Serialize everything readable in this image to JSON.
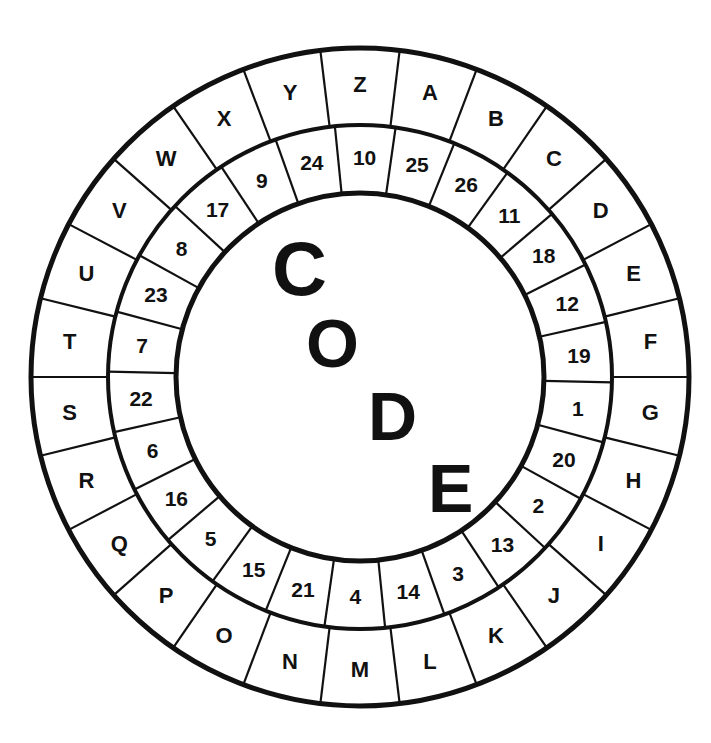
{
  "diagram": {
    "title_letters": [
      "C",
      "O",
      "D",
      "E"
    ],
    "colors": {
      "ink": "#111111",
      "background": "#ffffff"
    },
    "direction": "clockwise from top",
    "segments": [
      {
        "letter": "Z",
        "number": "10"
      },
      {
        "letter": "A",
        "number": "25"
      },
      {
        "letter": "B",
        "number": "26"
      },
      {
        "letter": "C",
        "number": "11"
      },
      {
        "letter": "D",
        "number": "18"
      },
      {
        "letter": "E",
        "number": "12"
      },
      {
        "letter": "F",
        "number": "19"
      },
      {
        "letter": "G",
        "number": "1"
      },
      {
        "letter": "H",
        "number": "20"
      },
      {
        "letter": "I",
        "number": "2"
      },
      {
        "letter": "J",
        "number": "13"
      },
      {
        "letter": "K",
        "number": "3"
      },
      {
        "letter": "L",
        "number": "14"
      },
      {
        "letter": "M",
        "number": "4"
      },
      {
        "letter": "N",
        "number": "21"
      },
      {
        "letter": "O",
        "number": "15"
      },
      {
        "letter": "P",
        "number": "5"
      },
      {
        "letter": "Q",
        "number": "16"
      },
      {
        "letter": "R",
        "number": "6"
      },
      {
        "letter": "S",
        "number": "22"
      },
      {
        "letter": "T",
        "number": "7"
      },
      {
        "letter": "U",
        "number": "23"
      },
      {
        "letter": "V",
        "number": "8"
      },
      {
        "letter": "W",
        "number": "17"
      },
      {
        "letter": "X",
        "number": "9"
      },
      {
        "letter": "Y",
        "number": "24"
      }
    ]
  }
}
